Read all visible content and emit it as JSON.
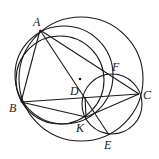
{
  "figure": {
    "type": "geometry-diagram",
    "points": {
      "A": {
        "label": "A",
        "x": 40,
        "y": 30,
        "lx": 33,
        "ly": 26
      },
      "B": {
        "label": "B",
        "x": 21,
        "y": 102,
        "lx": 9,
        "ly": 112
      },
      "C": {
        "label": "C",
        "x": 139,
        "y": 94,
        "lx": 143,
        "ly": 99
      },
      "D": {
        "label": "D",
        "x": 85,
        "y": 97,
        "lx": 70,
        "ly": 95
      },
      "F": {
        "label": "F",
        "x": 110,
        "y": 75,
        "lx": 112,
        "ly": 71
      },
      "K": {
        "label": "K",
        "x": 86,
        "y": 117,
        "lx": 76,
        "ly": 132
      },
      "E": {
        "label": "E",
        "x": 109,
        "y": 135,
        "lx": 104,
        "ly": 149
      },
      "O": {
        "label": "",
        "x": 80,
        "y": 79
      }
    },
    "segments": [
      [
        "A",
        "B"
      ],
      [
        "A",
        "C"
      ],
      [
        "B",
        "C"
      ],
      [
        "A",
        "E"
      ],
      [
        "B",
        "K"
      ],
      [
        "K",
        "C"
      ],
      [
        "D",
        "K"
      ]
    ],
    "circles": [
      {
        "name": "circumcircle-ABC",
        "cx": 81,
        "cy": 79,
        "r": 62
      },
      {
        "name": "circle-ABFK",
        "cx": 64,
        "cy": 75,
        "r": 49
      },
      {
        "name": "circle-ABK",
        "cx": 60,
        "cy": 80,
        "r": 44
      },
      {
        "name": "circle-FCEK",
        "cx": 112,
        "cy": 104,
        "r": 30
      }
    ],
    "center_dot": "O"
  }
}
